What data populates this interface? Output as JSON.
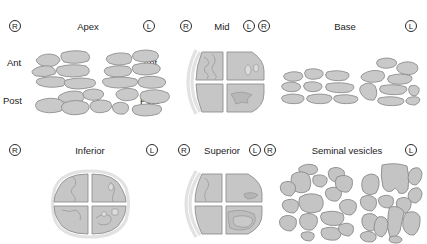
{
  "figure": {
    "colors": {
      "tissue_fill": "#c9c9c9",
      "tissue_outline": "#8e8e8e",
      "halo": "#e2e2e2",
      "text": "#1b1b1b",
      "background": "#ffffff"
    }
  },
  "panels": [
    {
      "id": "apex",
      "title": "Apex",
      "left_marker": "R",
      "right_marker": "L",
      "side_labels": {
        "top_left": "Ant",
        "top_right": "Ant",
        "bottom_left": "Post",
        "bottom_right": "Post"
      },
      "kind": "fragments"
    },
    {
      "id": "mid",
      "title": "Mid",
      "left_marker": "R",
      "right_marker": "L",
      "kind": "quadrant"
    },
    {
      "id": "base",
      "title": "Base",
      "left_marker": "R",
      "right_marker": "L",
      "kind": "fragments"
    },
    {
      "id": "inferior",
      "title": "Inferior",
      "left_marker": "R",
      "right_marker": "L",
      "kind": "quadrant"
    },
    {
      "id": "superior",
      "title": "Superior",
      "left_marker": "R",
      "right_marker": "L",
      "kind": "quadrant"
    },
    {
      "id": "seminal-vesicles",
      "title": "Seminal vesicles",
      "left_marker": "R",
      "right_marker": "L",
      "kind": "fragments"
    }
  ]
}
